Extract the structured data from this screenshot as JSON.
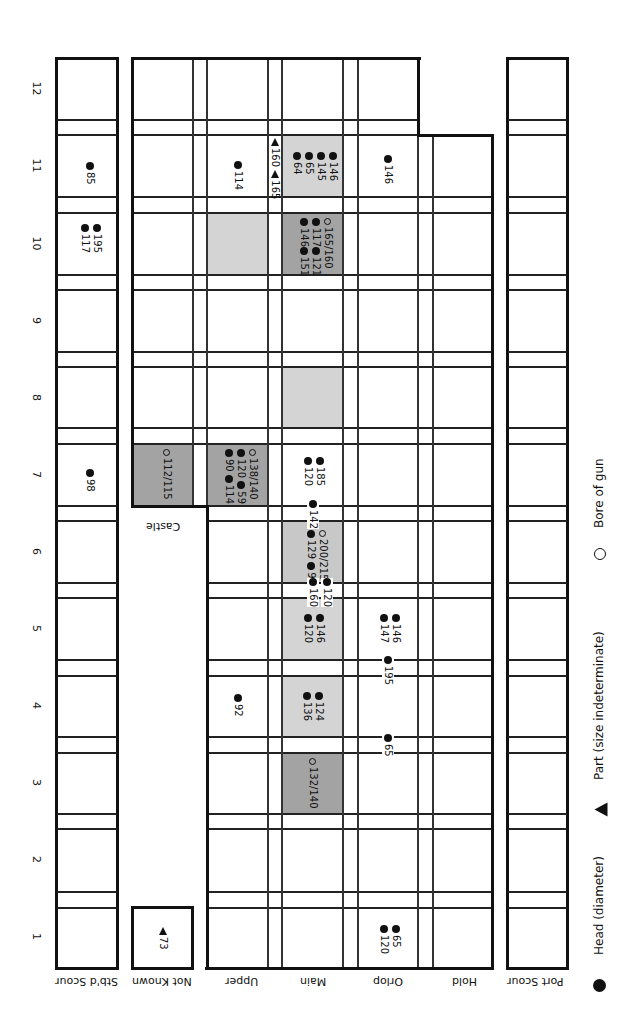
{
  "colors": {
    "dark_shade": "#a3a3a3",
    "light_shade": "#d4d4d4",
    "line": "#111111"
  },
  "columns": {
    "stbd_scour": "Stb'd Scour",
    "not_known": "Not Known",
    "upper": "Upper",
    "main": "Main",
    "orlop": "Orlop",
    "hold": "Hold",
    "port_scour": "Port Scour"
  },
  "castle_label": "Castle",
  "sections": [
    "1",
    "2",
    "3",
    "4",
    "5",
    "6",
    "7",
    "8",
    "9",
    "10",
    "11",
    "12"
  ],
  "legend": {
    "head": "Head (diameter)",
    "part": "Part (size indeterminate)",
    "bore": "Bore of gun"
  },
  "finds": {
    "stbd_11": [
      "85"
    ],
    "stbd_10": [
      "195",
      "117"
    ],
    "stbd_7": [
      "98"
    ],
    "notknown_1": [
      "73"
    ],
    "castle_7": [
      "112/115"
    ],
    "upper_11": [
      "114"
    ],
    "upper_7": [
      "138/140",
      "120",
      "59",
      "90",
      "114"
    ],
    "upper_4": [
      "92"
    ],
    "gap_upper_main_11": [
      "160",
      "165"
    ],
    "main_11": [
      "146",
      "145",
      "65",
      "64"
    ],
    "main_10": [
      "165/160",
      "117",
      "121",
      "146",
      "151"
    ],
    "main_7": [
      "185",
      "120"
    ],
    "main_line_6_7": [
      "142"
    ],
    "main_6": [
      "200/215",
      "129",
      "95"
    ],
    "main_line_5_6": [
      "120",
      "160"
    ],
    "main_5": [
      "146",
      "120"
    ],
    "main_4": [
      "124",
      "136"
    ],
    "main_3": [
      "132/140"
    ],
    "orlop_11": [
      "146"
    ],
    "orlop_5": [
      "146",
      "147"
    ],
    "orlop_line_4_5": [
      "195"
    ],
    "orlop_line_3_4": [
      "65"
    ],
    "orlop_1": [
      "65",
      "120"
    ]
  }
}
